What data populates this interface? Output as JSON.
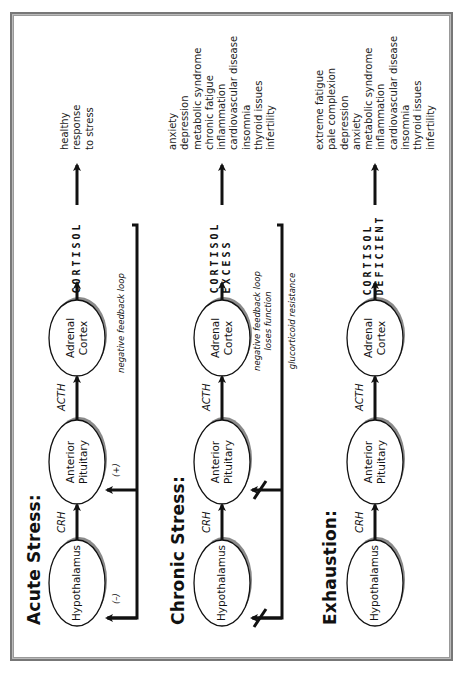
{
  "rows": [
    {
      "title": "Acute Stress:",
      "nodes": [
        "Hypothalamus",
        "Anterior\nPituitary",
        "Adrenal\nCortex"
      ],
      "node_lines": [
        [
          "Hypothalamus"
        ],
        [
          "Anterior",
          "Pituitary"
        ],
        [
          "Adrenal",
          "Cortex"
        ]
      ],
      "hormones": [
        "CRH",
        "ACTH"
      ],
      "cortisol_letters": [
        [
          "C",
          "O",
          "R",
          "T",
          "I",
          "S",
          "O",
          "L"
        ]
      ],
      "feedback_note": "negative feedback loop",
      "feedback_marks": [
        "(–)",
        "(+)"
      ],
      "effects": [
        "healthy",
        "response",
        "to stress"
      ]
    },
    {
      "title": "Chronic Stress:",
      "node_lines": [
        [
          "Hypothalamus"
        ],
        [
          "Anterior",
          "Pituitary"
        ],
        [
          "Adrenal",
          "Cortex"
        ]
      ],
      "hormones": [
        "CRH",
        "ACTH"
      ],
      "cortisol_letters": [
        [
          "E",
          "X",
          "C",
          "E",
          "S",
          "S"
        ],
        [
          "C",
          "O",
          "R",
          "T",
          "I",
          "S",
          "O",
          "L"
        ]
      ],
      "feedback_note_lines": [
        "negative feedback loop",
        "loses function"
      ],
      "resistance_note": "glucorticoid resistance",
      "effects": [
        "anxiety",
        "depression",
        "metabolic syndrome",
        "chronic fatigue",
        "inflammation",
        "cardiovascular disease",
        "insomnia",
        "thyroid issues",
        "infertility"
      ]
    },
    {
      "title": "Exhaustion:",
      "node_lines": [
        [
          "Hypothalamus"
        ],
        [
          "Anterior",
          "Pituitary"
        ],
        [
          "Adrenal",
          "Cortex"
        ]
      ],
      "hormones": [
        "CRH",
        "ACTH"
      ],
      "cortisol_letters": [
        [
          "D",
          "E",
          "F",
          "I",
          "C",
          "I",
          "E",
          "N",
          "T"
        ],
        [
          "C",
          "O",
          "R",
          "T",
          "I",
          "S",
          "O",
          "L"
        ]
      ],
      "effects": [
        "extreme fatigue",
        "pale complexion",
        "depression",
        "anxiety",
        "metabolic syndrome",
        "inflammation",
        "cardiovascular disease",
        "insomnia",
        "thyroid issues",
        "infertility"
      ]
    }
  ],
  "colors": {
    "line": "#111111",
    "shadow": "#8a8a8a",
    "frame": "#777777"
  }
}
